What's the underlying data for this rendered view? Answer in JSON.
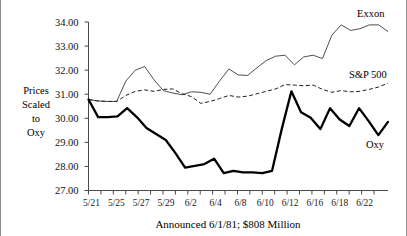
{
  "chart_data": {
    "type": "line",
    "title": "",
    "caption": "Announced 6/1/81;  $808 Million",
    "ylabel": "Prices Scaled to Oxy",
    "ylabel_lines": [
      "Prices",
      "Scaled",
      "to",
      "Oxy"
    ],
    "xlabel": "",
    "ylim": [
      27.0,
      34.0
    ],
    "ytick_values": [
      27.0,
      28.0,
      29.0,
      30.0,
      31.0,
      32.0,
      33.0,
      34.0
    ],
    "ytick_labels": [
      "27.00",
      "28.00",
      "29.00",
      "30.00",
      "31.00",
      "32.00",
      "33.00",
      "34.00"
    ],
    "grid": false,
    "legend_position": "inline-right",
    "x_tick_labels": [
      "5/21",
      "5/25",
      "5/27",
      "5/29",
      "6/2",
      "6/4",
      "6/8",
      "6/10",
      "6/12",
      "6/16",
      "6/18",
      "6/22"
    ],
    "x_index_count": 24,
    "series": [
      {
        "name": "Exxon",
        "style": "thin-solid",
        "color": "#3b3b3b",
        "values": [
          30.78,
          30.72,
          30.7,
          30.7,
          31.55,
          32.0,
          32.15,
          31.6,
          31.15,
          31.05,
          30.98,
          31.1,
          31.08,
          31.0,
          31.55,
          32.05,
          31.8,
          31.78,
          32.1,
          32.4,
          32.58,
          32.62,
          32.22,
          32.55,
          32.62,
          32.48,
          33.45,
          33.88,
          33.65,
          33.72,
          33.88,
          33.88,
          33.6
        ]
      },
      {
        "name": "S&P 500",
        "style": "dashed",
        "color": "#1f1f1f",
        "values": [
          30.78,
          30.72,
          30.7,
          30.7,
          30.95,
          31.12,
          31.18,
          31.12,
          31.2,
          31.22,
          31.02,
          30.9,
          30.62,
          30.7,
          30.82,
          30.95,
          30.88,
          30.92,
          31.02,
          31.12,
          31.22,
          31.4,
          31.38,
          31.35,
          31.38,
          31.2,
          31.08,
          31.15,
          31.1,
          31.12,
          31.2,
          31.3,
          31.46
        ]
      },
      {
        "name": "Oxy",
        "style": "bold-solid",
        "color": "#000000",
        "values": [
          30.78,
          30.05,
          30.05,
          30.08,
          30.42,
          30.05,
          29.6,
          29.35,
          29.1,
          28.55,
          27.95,
          28.02,
          28.1,
          28.32,
          27.72,
          27.82,
          27.75,
          27.75,
          27.72,
          27.82,
          29.55,
          31.12,
          30.25,
          30.02,
          29.55,
          30.42,
          29.95,
          29.68,
          30.42,
          29.88,
          29.3,
          29.85
        ]
      }
    ]
  },
  "series_labels": {
    "exxon": "Exxon",
    "sp500": "S&P 500",
    "oxy": "Oxy"
  }
}
